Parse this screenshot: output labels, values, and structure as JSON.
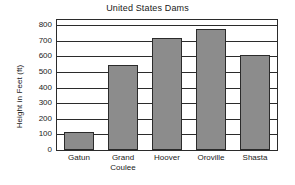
{
  "chart_data": {
    "type": "bar",
    "title": "United States Dams",
    "xlabel": "",
    "ylabel": "Height in Feet (ft)",
    "categories": [
      "Gatun",
      "Grand Coulee",
      "Hoover",
      "Oroville",
      "Shasta"
    ],
    "category_lines": [
      [
        "Gatun",
        ""
      ],
      [
        "Grand",
        "Coulee"
      ],
      [
        "Hoover",
        ""
      ],
      [
        "Oroville",
        ""
      ],
      [
        "Shasta",
        ""
      ]
    ],
    "values": [
      115,
      545,
      720,
      775,
      605
    ],
    "ylim": [
      0,
      800
    ],
    "ytick_labels": [
      "0",
      "100",
      "200",
      "300",
      "400",
      "500",
      "600",
      "700",
      "800"
    ],
    "ytick_values": [
      0,
      100,
      200,
      300,
      400,
      500,
      600,
      700,
      800
    ],
    "grid": true,
    "legend": "none",
    "bar_color": "#8c8c8c",
    "line_color": "#2b2b2b",
    "background": "#ffffff"
  }
}
